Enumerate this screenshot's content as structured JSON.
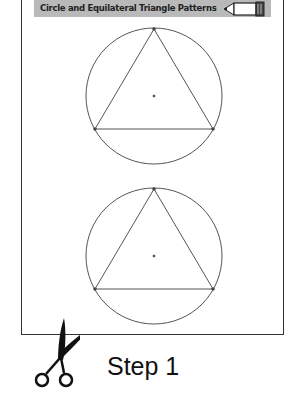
{
  "banner": {
    "title": "Circle and Equilateral Triangle Patterns",
    "icon": "pencil-icon"
  },
  "patterns": [
    {
      "shape": "circle-with-inscribed-equilateral-triangle",
      "center": [
        154,
        96
      ],
      "radius": 68
    },
    {
      "shape": "circle-with-inscribed-equilateral-triangle",
      "center": [
        154,
        256
      ],
      "radius": 68
    }
  ],
  "footer": {
    "icon": "scissors-icon",
    "step_label": "Step 1"
  },
  "colors": {
    "banner_bg": "#b9b9b9",
    "line": "#555555",
    "text": "#111111"
  }
}
